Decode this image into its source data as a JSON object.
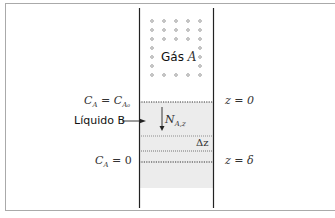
{
  "diagram": {
    "title": "",
    "gas_label": {
      "text": "Gás",
      "var": "A"
    },
    "liquid_label": "Líquido B",
    "flux_label": {
      "main": "N",
      "sub": "A,z"
    },
    "delta_z_label": "Δz",
    "left_labels": {
      "top": {
        "lhs": "C",
        "lhs_sub": "A",
        "eq": " = ",
        "rhs": "C",
        "rhs_sub": "A₀"
      },
      "bottom": {
        "lhs": "C",
        "lhs_sub": "A",
        "eq": " = ",
        "rhs": "0"
      }
    },
    "right_labels": {
      "top": "z = 0",
      "bottom": "z = δ"
    },
    "colors": {
      "liquid_fill": "#ececec",
      "wall": "#222222",
      "dots": "#777777",
      "frame": "#aaaaaa"
    }
  }
}
